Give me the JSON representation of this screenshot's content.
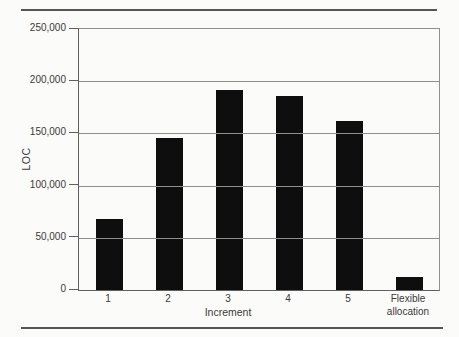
{
  "figure": {
    "background_color": "#fbfbf9",
    "rule_color": "#555555"
  },
  "chart_data": {
    "type": "bar",
    "title": "",
    "xlabel": "Increment",
    "ylabel": "LOC",
    "categories": [
      "1",
      "2",
      "3",
      "4",
      "5",
      "Flexible allocation"
    ],
    "values": [
      68000,
      146000,
      192000,
      186000,
      162000,
      12000
    ],
    "ylim": [
      0,
      250000
    ],
    "ytick_interval": 50000,
    "ytick_labels_top_to_bottom": [
      "250,000",
      "200,000",
      "150,000",
      "100,000",
      "50,000",
      "0"
    ],
    "grid": "horizontal",
    "legend": "none",
    "bar_color": "#0e0e0e",
    "gridline_color": "#8f8f8f",
    "axis_color": "#5f5f5f"
  }
}
